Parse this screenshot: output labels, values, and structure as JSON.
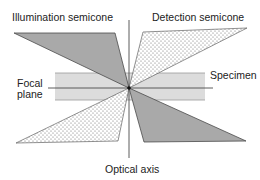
{
  "diagram": {
    "type": "optical-geometry",
    "labels": {
      "illumination": "Illumination  semicone",
      "detection": "Detection  semicone",
      "focal_line1": "Focal",
      "focal_line2": "plane",
      "specimen": "Specimen",
      "optical_axis": "Optical  axis"
    },
    "colors": {
      "illumination_fill": "#a9a9a9",
      "detection_fill": "#ffffff",
      "detection_dots": "#6e6e6e",
      "specimen_fill": "#dcdcdc",
      "line": "#4a4a4a",
      "focal_point": "#111111"
    },
    "focal_point": {
      "x": 129,
      "y": 88
    },
    "elements": [
      {
        "name": "illumination-semicone-upper",
        "fill": "solid-gray"
      },
      {
        "name": "detection-semicone-upper",
        "fill": "dotted"
      },
      {
        "name": "detection-semicone-lower",
        "fill": "dotted"
      },
      {
        "name": "illumination-semicone-lower",
        "fill": "solid-gray"
      },
      {
        "name": "specimen-band"
      },
      {
        "name": "focal-plane-line"
      },
      {
        "name": "optical-axis-line"
      }
    ]
  }
}
